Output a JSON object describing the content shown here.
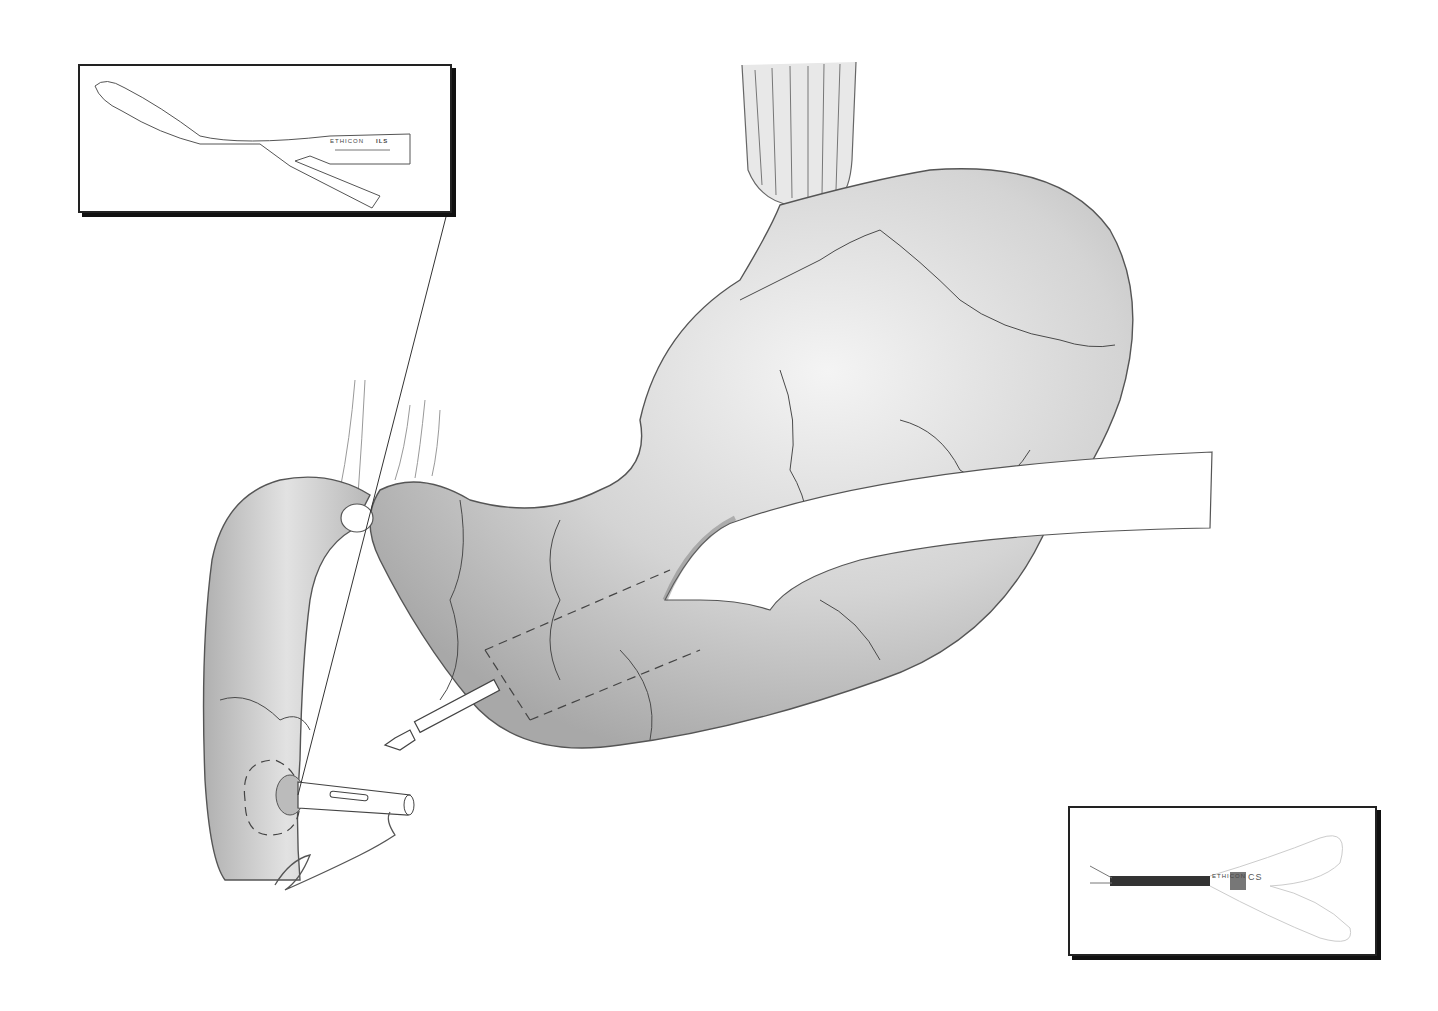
{
  "illustration": {
    "subject": "stomach-surgical-illustration",
    "colors": {
      "background": "#ffffff",
      "organ_fill": "#d6d6d6",
      "organ_shade": "#a9a9a9",
      "outline": "#555555",
      "vessels": "#4a4a4a",
      "inset_border": "#222222"
    },
    "insets": [
      {
        "name": "stapler-instrument-inset",
        "label": "ETHICON",
        "model": "ILS"
      },
      {
        "name": "endoscope-instrument-inset",
        "label": "ETHICON",
        "model": "CS"
      }
    ],
    "signature": "Jakoshi"
  }
}
